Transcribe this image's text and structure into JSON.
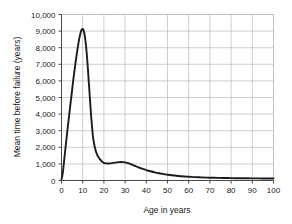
{
  "chart_data": {
    "type": "line",
    "title": "",
    "xlabel": "Age in years",
    "ylabel": "Mean time before failure (years)",
    "xlim": [
      0,
      100
    ],
    "ylim": [
      0,
      10000
    ],
    "grid": true,
    "legend": "none",
    "series_color": "#1c1c1c",
    "grid_color": "#b9b9b9",
    "axis_color": "#4a4a4a",
    "background_color": "#ffffff",
    "x_ticks": [
      "0",
      "10",
      "20",
      "30",
      "40",
      "50",
      "60",
      "70",
      "80",
      "90",
      "100"
    ],
    "x_tick_values": [
      0,
      10,
      20,
      30,
      40,
      50,
      60,
      70,
      80,
      90,
      100
    ],
    "y_ticks": [
      "0",
      "1,000",
      "2,000",
      "3,000",
      "4,000",
      "5,000",
      "6,000",
      "7,000",
      "8,000",
      "9,000",
      "10,000"
    ],
    "y_tick_values": [
      0,
      1000,
      2000,
      3000,
      4000,
      5000,
      6000,
      7000,
      8000,
      9000,
      10000
    ],
    "series": [
      {
        "name": "Mean time before failure",
        "x": [
          0,
          0.5,
          1,
          1.5,
          2,
          2.5,
          3,
          3.5,
          4,
          4.5,
          5,
          5.5,
          6,
          6.5,
          7,
          7.5,
          8,
          8.5,
          9,
          9.3,
          9.7,
          10,
          10.3,
          10.7,
          11,
          11.5,
          12,
          12.5,
          13,
          13.5,
          14,
          14.5,
          15,
          16,
          17,
          18,
          19,
          20,
          21,
          22,
          23,
          24,
          25,
          26,
          27,
          28,
          29,
          30,
          31,
          32,
          33,
          34,
          35,
          36,
          38,
          40,
          42,
          44,
          46,
          48,
          50,
          52,
          55,
          58,
          60,
          63,
          66,
          70,
          74,
          78,
          82,
          86,
          90,
          95,
          100
        ],
        "y": [
          80,
          350,
          900,
          1500,
          2100,
          2700,
          3250,
          3800,
          4350,
          4900,
          5450,
          6000,
          6500,
          6980,
          7450,
          7880,
          8280,
          8620,
          8900,
          9030,
          9120,
          9130,
          9080,
          8930,
          8700,
          8200,
          7500,
          6650,
          5700,
          4750,
          3850,
          3100,
          2500,
          1850,
          1500,
          1300,
          1150,
          1060,
          1030,
          1020,
          1030,
          1050,
          1075,
          1095,
          1105,
          1110,
          1105,
          1090,
          1060,
          1020,
          970,
          915,
          860,
          805,
          710,
          625,
          555,
          490,
          435,
          390,
          350,
          315,
          275,
          245,
          230,
          205,
          190,
          170,
          158,
          148,
          140,
          135,
          130,
          125,
          122
        ]
      }
    ]
  }
}
